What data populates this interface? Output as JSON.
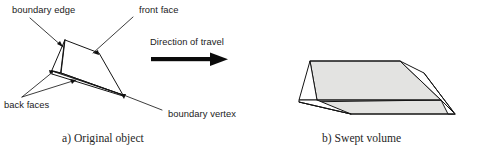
{
  "figure": {
    "labels": {
      "boundary_edge": "boundary edge",
      "front_face": "front face",
      "back_faces": "back faces",
      "boundary_vertex": "boundary vertex",
      "direction_of_travel": "Direction of travel"
    },
    "captions": {
      "a": "a) Original object",
      "b": "b) Swept volume"
    },
    "colors": {
      "ink": "#141414",
      "shaded_face": "#e3e3e1",
      "white_face": "#ffffff",
      "background": "#ffffff",
      "text": "#1b1b1b"
    },
    "panels": [
      {
        "id": "a",
        "name": "original-object",
        "caption": "a) Original object",
        "description": "Wireframe polyhedron with labelled boundary edge, front face, back faces and boundary vertex"
      },
      {
        "id": "b",
        "name": "swept-volume",
        "caption": "b) Swept volume",
        "description": "Shaded prismatic volume swept along the direction of travel"
      }
    ]
  }
}
